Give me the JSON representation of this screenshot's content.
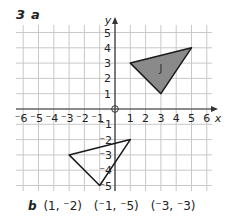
{
  "question": {
    "number": "3",
    "part_a": "a",
    "part_b": "b"
  },
  "axes": {
    "x_label": "x",
    "y_label": "y",
    "x_ticks": [
      "⁻6",
      "⁻5",
      "⁻4",
      "⁻3",
      "⁻2",
      "⁻1",
      "1",
      "2",
      "3",
      "4",
      "5",
      "6"
    ],
    "y_ticks_pos": [
      "1",
      "2",
      "3",
      "4",
      "5"
    ],
    "y_ticks_neg": [
      "⁻1",
      "⁻2",
      "⁻3",
      "⁻4",
      "⁻5"
    ],
    "range": {
      "x": [
        -6,
        6
      ],
      "y": [
        -5,
        5
      ]
    }
  },
  "shapes": [
    {
      "name": "J",
      "label": "J",
      "vertices": [
        [
          1,
          3
        ],
        [
          5,
          4
        ],
        [
          3,
          1
        ]
      ],
      "fill": "#8a8a8a"
    },
    {
      "name": "image",
      "label": "",
      "vertices": [
        [
          1,
          -2
        ],
        [
          -1,
          -5
        ],
        [
          -3,
          -3
        ]
      ],
      "fill": "none"
    }
  ],
  "answer_b": {
    "label": "b",
    "points": [
      "(1, ⁻2)",
      "(⁻1, ⁻5)",
      "(⁻3, ⁻3)"
    ]
  },
  "colors": {
    "grid": "#c8c8c8",
    "axis": "#333333",
    "text": "#222222",
    "shape_fill": "#8a8a8a"
  }
}
